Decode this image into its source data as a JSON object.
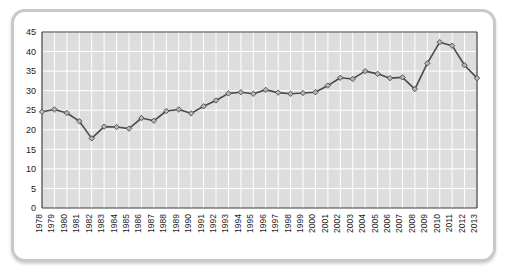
{
  "card": {
    "border_color": "#c9c9c9",
    "background": "#ffffff"
  },
  "chart_data": {
    "type": "line",
    "title": "",
    "subtitle": "",
    "xlabel": "",
    "ylabel": "",
    "grid": true,
    "legend": "none",
    "plot_background": "#dddddd",
    "gridline_color": "#ffffff",
    "line_color": "#4a4a4a",
    "marker_color": "#b8b8b8",
    "marker_shape": "diamond",
    "ylim": [
      0,
      45
    ],
    "yticks": [
      0,
      5,
      10,
      15,
      20,
      25,
      30,
      35,
      40,
      45
    ],
    "ytick_labels": [
      "0",
      "5",
      "10",
      "15",
      "20",
      "25",
      "30",
      "35",
      "40",
      "45"
    ],
    "categories": [
      "1978",
      "1979",
      "1980",
      "1981",
      "1982",
      "1983",
      "1984",
      "1985",
      "1986",
      "1987",
      "1988",
      "1989",
      "1990",
      "1991",
      "1992",
      "1993",
      "1994",
      "1995",
      "1996",
      "1997",
      "1998",
      "1999",
      "2000",
      "2001",
      "2002",
      "2003",
      "2004",
      "2005",
      "2006",
      "2007",
      "2008",
      "2009",
      "2010",
      "2011",
      "2012",
      "2013"
    ],
    "values": [
      24.6,
      25.2,
      24.3,
      22.2,
      17.8,
      20.8,
      20.7,
      20.3,
      23.0,
      22.3,
      24.8,
      25.2,
      24.2,
      26.0,
      27.5,
      29.3,
      29.6,
      29.2,
      30.2,
      29.5,
      29.2,
      29.4,
      29.6,
      31.3,
      33.3,
      33.0,
      35.0,
      34.3,
      33.2,
      33.4,
      30.4,
      37.0,
      42.4,
      41.5,
      36.5,
      33.2
    ]
  }
}
